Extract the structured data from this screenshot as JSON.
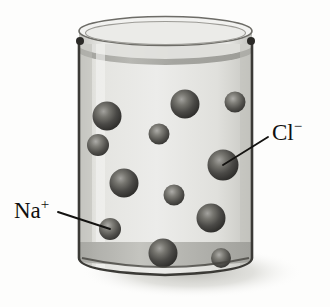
{
  "figure": {
    "name": "aqueous-sodium-chloride-beaker",
    "background_color": "#fdfdfc"
  },
  "labels": [
    {
      "id": "chloride",
      "symbol": "Cl",
      "charge": "−",
      "text": "Cl−",
      "x": 272,
      "y": 140,
      "anchor": "start",
      "leader": {
        "x1": 268,
        "y1": 137,
        "x2": 223,
        "y2": 165
      }
    },
    {
      "id": "sodium",
      "symbol": "Na",
      "charge": "+",
      "text": "Na+",
      "x": 14,
      "y": 218,
      "anchor": "start",
      "leader": {
        "x1": 58,
        "y1": 212,
        "x2": 110,
        "y2": 229
      }
    }
  ],
  "beaker": {
    "glass_color": "#d8d8d4",
    "glass_outline_color": "#3b3a36",
    "liquid_color": "#e9e9e6",
    "liquid_surface_color": "#a9a9a4",
    "bottom_band_color": "#b4b4af",
    "shadow_color": "#cfcfc9",
    "rim_top_y": 18,
    "rim_bottom_y": 44,
    "wall_left_x": 79,
    "wall_right_x": 252,
    "base_y": 272
  },
  "ions": {
    "sphere_color_dark": "#2e2d2b",
    "sphere_color_mid": "#5e5d5a",
    "sphere_highlight": "#b9b8b4",
    "list": [
      {
        "id": "ion-1",
        "cx": 107,
        "cy": 116,
        "r": 14.5,
        "species": "chloride"
      },
      {
        "id": "ion-2",
        "cx": 185,
        "cy": 104,
        "r": 14.5,
        "species": "chloride"
      },
      {
        "id": "ion-3",
        "cx": 235,
        "cy": 102,
        "r": 10.5,
        "species": "sodium"
      },
      {
        "id": "ion-4",
        "cx": 159,
        "cy": 134,
        "r": 10.5,
        "species": "sodium"
      },
      {
        "id": "ion-5",
        "cx": 98,
        "cy": 145,
        "r": 11.0,
        "species": "sodium"
      },
      {
        "id": "ion-6",
        "cx": 223,
        "cy": 165,
        "r": 15.5,
        "species": "chloride"
      },
      {
        "id": "ion-7",
        "cx": 124,
        "cy": 183,
        "r": 14.5,
        "species": "chloride"
      },
      {
        "id": "ion-8",
        "cx": 174,
        "cy": 195,
        "r": 10.5,
        "species": "sodium"
      },
      {
        "id": "ion-9",
        "cx": 211,
        "cy": 218,
        "r": 14.5,
        "species": "chloride"
      },
      {
        "id": "ion-10",
        "cx": 110,
        "cy": 229,
        "r": 11.0,
        "species": "sodium"
      },
      {
        "id": "ion-11",
        "cx": 163,
        "cy": 253,
        "r": 14.5,
        "species": "chloride"
      },
      {
        "id": "ion-12",
        "cx": 221,
        "cy": 258,
        "r": 10.0,
        "species": "sodium"
      }
    ]
  }
}
